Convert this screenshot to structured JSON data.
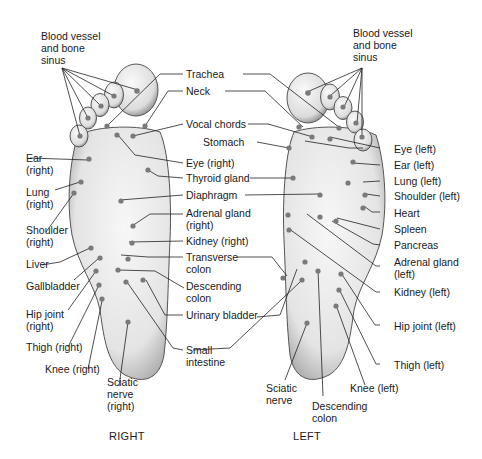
{
  "diagram": {
    "type": "foot reflexology map",
    "feet": [
      "RIGHT",
      "LEFT"
    ]
  },
  "captions": {
    "right": "RIGHT",
    "left": "LEFT"
  },
  "labels": {
    "blood_vessel_right": [
      "Blood vessel",
      "and bone",
      "sinus"
    ],
    "blood_vessel_left": [
      "Blood vessel",
      "and bone",
      "sinus"
    ],
    "trachea": "Trachea",
    "neck": "Neck",
    "vocal_chords": "Vocal chords",
    "stomach": "Stomach",
    "eye_right": "Eye (right)",
    "thyroid": "Thyroid gland",
    "diaphragm": "Diaphragm",
    "adrenal_right": [
      "Adrenal gland",
      "(right)"
    ],
    "kidney_right": "Kidney (right)",
    "transverse_colon": [
      "Transverse",
      "colon"
    ],
    "descending_colon_center": [
      "Descending",
      "colon"
    ],
    "urinary_bladder": "Urinary bladder",
    "small_intestine": [
      "Small",
      "intestine"
    ],
    "ear_right": [
      "Ear",
      "(right)"
    ],
    "lung_right": [
      "Lung",
      "(right)"
    ],
    "shoulder_right": [
      "Shoulder",
      "(right)"
    ],
    "liver": "Liver",
    "gallbladder": "Gallbladder",
    "hip_right": [
      "Hip joint",
      "(right)"
    ],
    "thigh_right": "Thigh (right)",
    "knee_right": "Knee (right)",
    "sciatic_right": [
      "Sciatic",
      "nerve",
      "(right)"
    ],
    "eye_left": "Eye (left)",
    "ear_left": "Ear (left)",
    "lung_left": "Lung (left)",
    "shoulder_left": "Shoulder (left)",
    "heart": "Heart",
    "spleen": "Spleen",
    "pancreas": "Pancreas",
    "adrenal_left": [
      "Adrenal gland",
      "(left)"
    ],
    "kidney_left": "Kidney (left)",
    "hip_left": "Hip joint (left)",
    "thigh_left": "Thigh (left)",
    "knee_left": "Knee (left)",
    "sciatic_left": [
      "Sciatic",
      "nerve"
    ],
    "descending_colon_left": [
      "Descending",
      "colon"
    ]
  },
  "colors": {
    "foot_fill": "#efefef",
    "foot_shade": "#9a9a9a",
    "point": "#7a7a7a",
    "line": "#222222"
  }
}
